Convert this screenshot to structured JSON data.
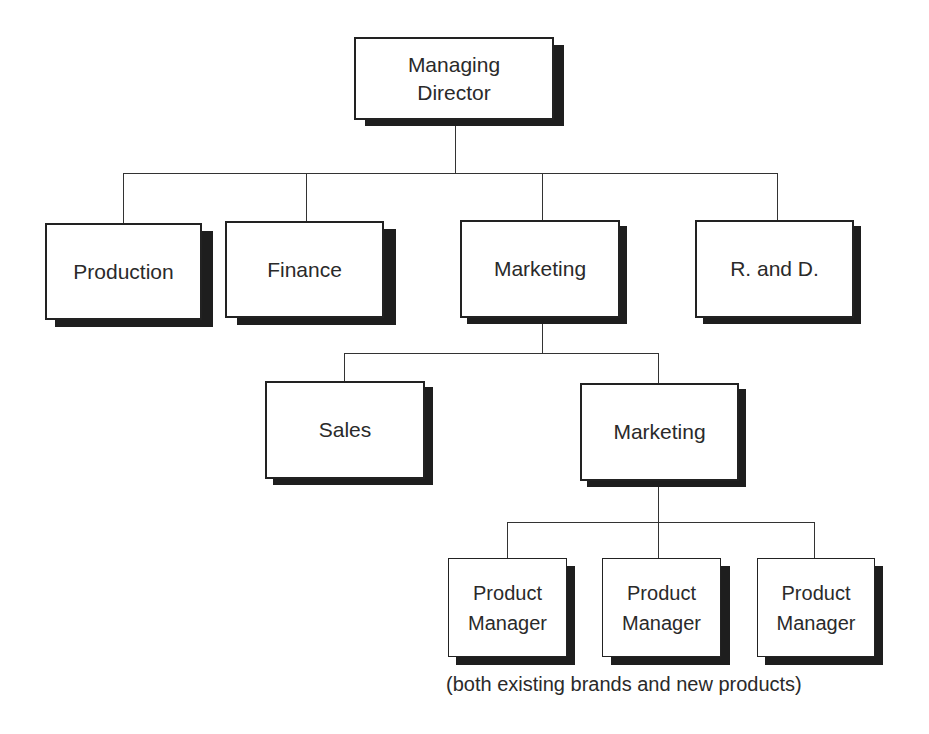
{
  "chart": {
    "type": "organization-chart",
    "nodes": {
      "managing_director": "Managing\nDirector",
      "production": "Production",
      "finance": "Finance",
      "marketing": "Marketing",
      "rnd": "R. and D.",
      "sales": "Sales",
      "marketing_sub": "Marketing",
      "product_manager_1": "Product\nManager",
      "product_manager_2": "Product\nManager",
      "product_manager_3": "Product\nManager"
    },
    "caption": "(both existing brands and new products)",
    "hierarchy": [
      {
        "parent": "Managing Director",
        "children": [
          "Production",
          "Finance",
          "Marketing",
          "R. and D."
        ]
      },
      {
        "parent": "Marketing",
        "children": [
          "Sales",
          "Marketing"
        ]
      },
      {
        "parent": "Marketing (sub)",
        "children": [
          "Product Manager",
          "Product Manager",
          "Product Manager"
        ]
      }
    ]
  }
}
